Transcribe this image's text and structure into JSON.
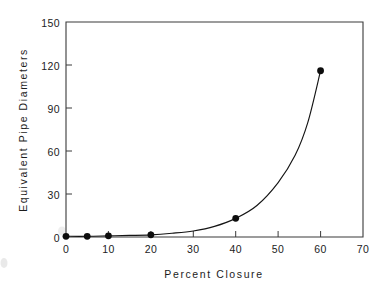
{
  "figure": {
    "background_color": "#ffffff",
    "line_color": "#151515",
    "marker_color": "#0d0d0d",
    "axis_color": "#3a3a3a"
  },
  "chart_data": {
    "type": "line",
    "title": "",
    "xlabel": "Percent Closure",
    "ylabel": "Equivalent Pipe Diameters",
    "xlim": [
      0,
      70
    ],
    "ylim": [
      0,
      150
    ],
    "xticks": [
      0,
      10,
      20,
      30,
      40,
      50,
      60,
      70
    ],
    "yticks": [
      0,
      30,
      60,
      90,
      120,
      150
    ],
    "xtick_labels": [
      "0",
      "10",
      "20",
      "30",
      "40",
      "50",
      "60",
      "70"
    ],
    "ytick_labels": [
      "0",
      "30",
      "60",
      "90",
      "120",
      "150"
    ],
    "grid": false,
    "legend": false,
    "tick_direction": "in",
    "series": [
      {
        "name": "Equivalent Pipe Diameters",
        "marker": "filled-circle",
        "line_style": "solid",
        "x": [
          0,
          5,
          10,
          20,
          40,
          60
        ],
        "values": [
          0.5,
          0.5,
          0.8,
          1.5,
          13,
          116
        ]
      }
    ],
    "curve_points": {
      "x": [
        0,
        5,
        10,
        15,
        20,
        25,
        30,
        35,
        40,
        45,
        50,
        54,
        57,
        60
      ],
      "y": [
        0.5,
        0.5,
        0.8,
        1.1,
        1.5,
        2.6,
        4.2,
        7.4,
        13,
        22,
        38,
        57,
        80,
        116
      ]
    }
  },
  "axes": {
    "x_axis_label": "Percent Closure",
    "y_axis_label": "Equivalent Pipe Diameters"
  }
}
